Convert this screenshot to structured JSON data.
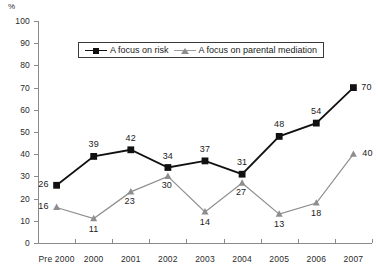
{
  "chart_data": {
    "type": "line",
    "title": "",
    "xlabel": "",
    "ylabel": "%",
    "ylim": [
      0,
      100
    ],
    "ytick_step": 10,
    "yticks": [
      "100",
      "90",
      "80",
      "70",
      "60",
      "50",
      "40",
      "30",
      "20",
      "10",
      "0"
    ],
    "categories": [
      "Pre 2000",
      "2000",
      "2001",
      "2002",
      "2003",
      "2004",
      "2005",
      "2006",
      "2007"
    ],
    "grid": false,
    "legend_position": "top-center",
    "series": [
      {
        "name": "A focus on risk",
        "marker": "square",
        "color": "#111111",
        "values": [
          26,
          39,
          42,
          34,
          37,
          31,
          48,
          54,
          70
        ],
        "labels": [
          "26",
          "39",
          "42",
          "34",
          "37",
          "31",
          "48",
          "54",
          "70"
        ]
      },
      {
        "name": "A focus on parental mediation",
        "marker": "triangle",
        "color": "#8e8e8e",
        "values": [
          16,
          11,
          23,
          30,
          14,
          27,
          13,
          18,
          40
        ],
        "labels": [
          "16",
          "11",
          "23",
          "30",
          "14",
          "27",
          "13",
          "18",
          "40"
        ]
      }
    ]
  },
  "axis": {
    "percent_symbol": "%"
  },
  "colors": {
    "risk": "#111111",
    "mediation": "#8e8e8e",
    "axis": "#8a8a8a",
    "text": "#1a1a1a"
  }
}
